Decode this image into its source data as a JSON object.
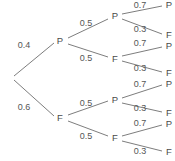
{
  "figure": {
    "background_color": "#ffffff",
    "line_color": "#6e6e6e",
    "text_color": "#4a4a4a"
  },
  "chart_data": {
    "type": "diagram",
    "subtype": "probability-tree",
    "title": "",
    "xlabel": "",
    "ylabel": "",
    "depth": 3,
    "outcome_symbols": [
      "P",
      "F"
    ],
    "root": {
      "id": "root",
      "label": "",
      "x": 12,
      "y": 78
    },
    "nodes": [
      {
        "id": "n-P",
        "label": "P",
        "x": 60,
        "y": 41,
        "level": 1
      },
      {
        "id": "n-F",
        "label": "F",
        "x": 60,
        "y": 118,
        "level": 1
      },
      {
        "id": "n-PP",
        "label": "P",
        "x": 115,
        "y": 16,
        "level": 2
      },
      {
        "id": "n-PF",
        "label": "F",
        "x": 115,
        "y": 59,
        "level": 2
      },
      {
        "id": "n-FP",
        "label": "P",
        "x": 115,
        "y": 100,
        "level": 2
      },
      {
        "id": "n-FF",
        "label": "F",
        "x": 115,
        "y": 138,
        "level": 2
      }
    ],
    "leaves": [
      {
        "id": "leaf-PPP",
        "label": "P",
        "x": 169,
        "y": 5,
        "path": [
          "P",
          "P",
          "P"
        ],
        "probability": 0.14
      },
      {
        "id": "leaf-PPF",
        "label": "F",
        "x": 169,
        "y": 35,
        "path": [
          "P",
          "P",
          "F"
        ],
        "probability": 0.06
      },
      {
        "id": "leaf-PFP",
        "label": "P",
        "x": 169,
        "y": 46,
        "path": [
          "P",
          "F",
          "P"
        ],
        "probability": 0.14
      },
      {
        "id": "leaf-PFF",
        "label": "F",
        "x": 169,
        "y": 73,
        "path": [
          "P",
          "F",
          "F"
        ],
        "probability": 0.06
      },
      {
        "id": "leaf-FPP",
        "label": "P",
        "x": 169,
        "y": 84,
        "path": [
          "F",
          "P",
          "P"
        ],
        "probability": 0.21
      },
      {
        "id": "leaf-FPF",
        "label": "F",
        "x": 169,
        "y": 113,
        "path": [
          "F",
          "P",
          "F"
        ],
        "probability": 0.09
      },
      {
        "id": "leaf-FFP",
        "label": "P",
        "x": 169,
        "y": 124,
        "path": [
          "F",
          "F",
          "P"
        ],
        "probability": 0.21
      },
      {
        "id": "leaf-FFF",
        "label": "F",
        "x": 169,
        "y": 152,
        "path": [
          "F",
          "F",
          "F"
        ],
        "probability": 0.09
      }
    ],
    "edges": [
      {
        "id": "e-root-P",
        "from": "root",
        "to": "n-P",
        "x1": 14,
        "y1": 76,
        "x2": 54,
        "y2": 43,
        "label": "0.4",
        "lx": 24,
        "ly": 46,
        "level": 1
      },
      {
        "id": "e-root-F",
        "from": "root",
        "to": "n-F",
        "x1": 14,
        "y1": 80,
        "x2": 54,
        "y2": 116,
        "label": "0.6",
        "lx": 24,
        "ly": 108,
        "level": 1
      },
      {
        "id": "e-P-PP",
        "from": "n-P",
        "to": "n-PP",
        "x1": 68,
        "y1": 38,
        "x2": 108,
        "y2": 19,
        "label": "0.5",
        "lx": 86,
        "ly": 24,
        "level": 2
      },
      {
        "id": "e-P-PF",
        "from": "n-P",
        "to": "n-PF",
        "x1": 68,
        "y1": 44,
        "x2": 108,
        "y2": 57,
        "label": "0.5",
        "lx": 86,
        "ly": 59,
        "level": 2
      },
      {
        "id": "e-F-FP",
        "from": "n-F",
        "to": "n-FP",
        "x1": 68,
        "y1": 115,
        "x2": 108,
        "y2": 101,
        "label": "0.5",
        "lx": 86,
        "ly": 104,
        "level": 2
      },
      {
        "id": "e-F-FF",
        "from": "n-F",
        "to": "n-FF",
        "x1": 68,
        "y1": 121,
        "x2": 108,
        "y2": 136,
        "label": "0.5",
        "lx": 86,
        "ly": 137,
        "level": 2
      },
      {
        "id": "e-PP-P",
        "from": "n-PP",
        "to": "leaf-PPP",
        "x1": 122,
        "y1": 14,
        "x2": 162,
        "y2": 6,
        "label": "0.7",
        "lx": 140,
        "ly": 6,
        "level": 3
      },
      {
        "id": "e-PP-F",
        "from": "n-PP",
        "to": "leaf-PPF",
        "x1": 122,
        "y1": 19,
        "x2": 162,
        "y2": 34,
        "label": "0.3",
        "lx": 140,
        "ly": 30,
        "level": 3
      },
      {
        "id": "e-PF-P",
        "from": "n-PF",
        "to": "leaf-PFP",
        "x1": 122,
        "y1": 56,
        "x2": 162,
        "y2": 47,
        "label": "0.7",
        "lx": 140,
        "ly": 44,
        "level": 3
      },
      {
        "id": "e-PF-F",
        "from": "n-PF",
        "to": "leaf-PFF",
        "x1": 122,
        "y1": 61,
        "x2": 162,
        "y2": 72,
        "label": "0.3",
        "lx": 140,
        "ly": 69,
        "level": 3
      },
      {
        "id": "e-FP-P",
        "from": "n-FP",
        "to": "leaf-FPP",
        "x1": 122,
        "y1": 98,
        "x2": 162,
        "y2": 85,
        "label": "0.7",
        "lx": 140,
        "ly": 85,
        "level": 3
      },
      {
        "id": "e-FP-F",
        "from": "n-FP",
        "to": "leaf-FPF",
        "x1": 122,
        "y1": 103,
        "x2": 162,
        "y2": 112,
        "label": "0.3",
        "lx": 140,
        "ly": 109,
        "level": 3
      },
      {
        "id": "e-FF-P",
        "from": "n-FF",
        "to": "leaf-FFP",
        "x1": 122,
        "y1": 136,
        "x2": 162,
        "y2": 125,
        "label": "0.7",
        "lx": 140,
        "ly": 124,
        "level": 3
      },
      {
        "id": "e-FF-F",
        "from": "n-FF",
        "to": "leaf-FFF",
        "x1": 122,
        "y1": 141,
        "x2": 162,
        "y2": 151,
        "label": "0.3",
        "lx": 140,
        "ly": 152,
        "level": 3
      }
    ],
    "probabilities_level1": [
      0.4,
      0.6
    ],
    "probabilities_level2": [
      0.5,
      0.5
    ],
    "probabilities_level3": [
      0.7,
      0.3
    ]
  }
}
